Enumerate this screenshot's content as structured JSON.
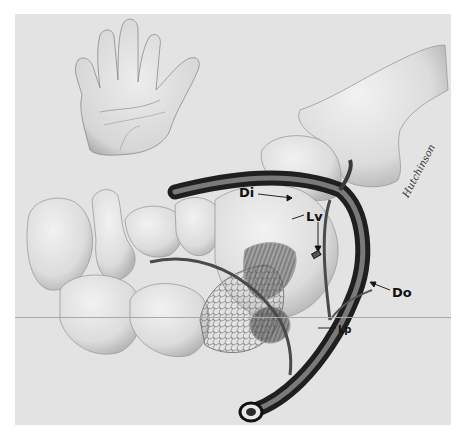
{
  "figure": {
    "background_color": "#e3e3e3",
    "labels": [
      {
        "id": "di",
        "text": "Di",
        "x": 239,
        "y": 186
      },
      {
        "id": "lv",
        "text": "Lv",
        "x": 306,
        "y": 210
      },
      {
        "id": "do",
        "text": "Do",
        "x": 392,
        "y": 286
      },
      {
        "id": "lp",
        "text": "Lp",
        "x": 338,
        "y": 324
      }
    ],
    "signature": "Hutchinson"
  }
}
